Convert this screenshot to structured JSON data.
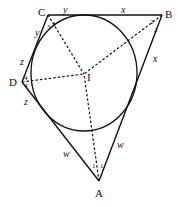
{
  "diagram": {
    "type": "geometry",
    "vertices": [
      {
        "name": "A",
        "label": "A",
        "x": 99,
        "y": 181
      },
      {
        "name": "B",
        "label": "B",
        "x": 162,
        "y": 15
      },
      {
        "name": "C",
        "label": "C",
        "x": 48,
        "y": 15
      },
      {
        "name": "D",
        "label": "D",
        "x": 22,
        "y": 82
      }
    ],
    "center": {
      "name": "I",
      "label": "I",
      "x": 84,
      "y": 74
    },
    "incircle": {
      "cx": 84,
      "cy": 73,
      "rx": 53,
      "ry": 58
    },
    "tangent_segment_labels": {
      "top_left": "y",
      "top_right": "x",
      "right_upper": "x",
      "right_lower": "w",
      "left_lower": "w",
      "left_middle_lower": "z",
      "left_middle_upper": "z",
      "left_upper": "y"
    },
    "angle_labels": {
      "C1": "3",
      "C2": "3",
      "B1": "2",
      "B2": "2",
      "D1": "4",
      "D2": "4",
      "A1": "1",
      "A2": "1"
    }
  }
}
